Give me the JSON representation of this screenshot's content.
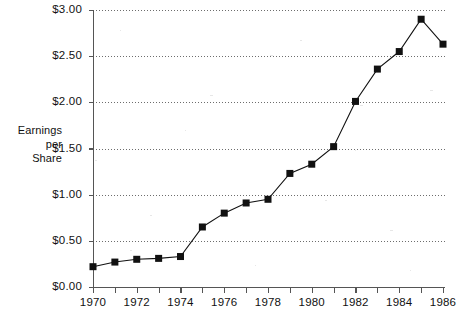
{
  "chart_data": {
    "type": "line",
    "title": "",
    "subtitle": "",
    "xlabel": "",
    "ylabel": "Earnings per Share",
    "ylabel_lines": [
      "Earnings",
      "per",
      "Share"
    ],
    "x": [
      1970,
      1971,
      1972,
      1973,
      1974,
      1975,
      1976,
      1977,
      1978,
      1979,
      1980,
      1981,
      1982,
      1983,
      1984,
      1985,
      1986
    ],
    "values": [
      0.22,
      0.27,
      0.3,
      0.31,
      0.33,
      0.65,
      0.8,
      0.91,
      0.95,
      1.23,
      1.33,
      1.52,
      2.01,
      2.36,
      2.55,
      2.9,
      2.63
    ],
    "series": [
      {
        "name": "Earnings per Share",
        "values": [
          0.22,
          0.27,
          0.3,
          0.31,
          0.33,
          0.65,
          0.8,
          0.91,
          0.95,
          1.23,
          1.33,
          1.52,
          2.01,
          2.36,
          2.55,
          2.9,
          2.63
        ]
      }
    ],
    "xlim": [
      1970,
      1986
    ],
    "ylim": [
      0.0,
      3.0
    ],
    "y_ticks": [
      0.0,
      0.5,
      1.0,
      1.5,
      2.0,
      2.5,
      3.0
    ],
    "y_tick_labels": [
      "$0.00",
      "$0.50",
      "$1.00",
      "$1.50",
      "$2.00",
      "$2.50",
      "$3.00"
    ],
    "x_ticks": [
      1970,
      1971,
      1972,
      1973,
      1974,
      1975,
      1976,
      1977,
      1978,
      1979,
      1980,
      1981,
      1982,
      1983,
      1984,
      1985,
      1986
    ],
    "x_tick_labels_shown": [
      {
        "value": 1970,
        "label": "1970"
      },
      {
        "value": 1972,
        "label": "1972"
      },
      {
        "value": 1974,
        "label": "1974"
      },
      {
        "value": 1976,
        "label": "1976"
      },
      {
        "value": 1978,
        "label": "1978"
      },
      {
        "value": 1980,
        "label": "1980"
      },
      {
        "value": 1982,
        "label": "1982"
      },
      {
        "value": 1984,
        "label": "1984"
      },
      {
        "value": 1986,
        "label": "1986"
      }
    ],
    "grid": {
      "horizontal": true,
      "vertical": false,
      "style": "dotted"
    },
    "legend": {
      "visible": false,
      "position": "none"
    },
    "marker": {
      "shape": "square",
      "color": "#111111",
      "size": 7
    },
    "line_color": "#111111",
    "background_color": "#ffffff",
    "annotations": []
  },
  "axis_title": {
    "line1": "Earnings",
    "line2": "per",
    "line3": "Share"
  }
}
